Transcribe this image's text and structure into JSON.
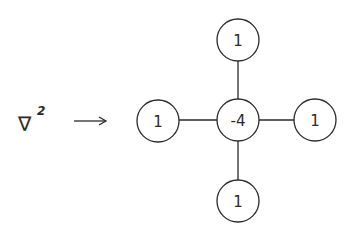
{
  "diagram": {
    "operator": {
      "symbol": "∇",
      "exponent": "2"
    },
    "arrow": "→",
    "stencil": {
      "center": {
        "label": "-4"
      },
      "top": {
        "label": "1"
      },
      "left": {
        "label": "1"
      },
      "right": {
        "label": "1"
      },
      "bottom": {
        "label": "1"
      }
    }
  }
}
